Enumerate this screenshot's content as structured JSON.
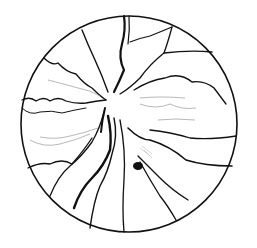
{
  "figure": {
    "description": "Line drawing of a retinal fundus with blood vessels inside a circular boundary",
    "colors": {
      "background": "#ffffff",
      "vessel": "#111111",
      "fine_vessel": "#9a9a9a",
      "lesion": "#111111"
    },
    "circle": {
      "cx": 129,
      "cy": 124,
      "r": 108
    }
  }
}
